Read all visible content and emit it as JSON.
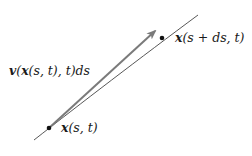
{
  "diagram": {
    "type": "vector-on-curve",
    "labels": {
      "start_point": "x(s, t)",
      "end_point": "x(s + ds, t)",
      "vector": "v(x(s, t), t)ds"
    },
    "parts": {
      "start_point": [
        "x",
        "(s, t)"
      ],
      "end_point": [
        "x",
        "(s + ds, t)"
      ],
      "vector": [
        "v",
        "(",
        "x",
        "(s, t), t)ds"
      ]
    },
    "colors": {
      "curve": "#444444",
      "arrow": "#7a7a7a",
      "point": "#111111",
      "text": "#1a1a1a"
    }
  }
}
